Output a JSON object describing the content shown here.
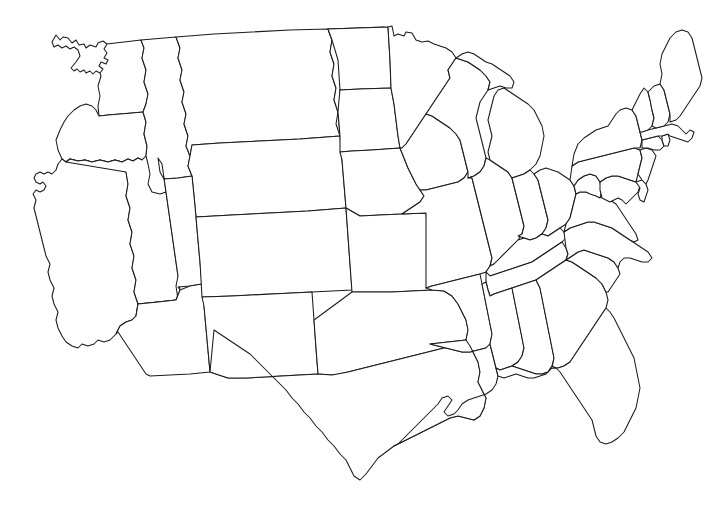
{
  "document": {
    "kind": "map",
    "title": "",
    "subtitle": "",
    "caption": "",
    "legend": "",
    "attribution": ""
  },
  "map": {
    "name": "contiguous-united-states-outline",
    "region": "United States (contiguous 48 states)",
    "projection_hint": "albers-like",
    "width": 723,
    "height": 505,
    "background_color": "#ffffff",
    "border_color": "#1a1a1a",
    "fill_color": "#ffffff",
    "border_width_px": 1,
    "labels_shown": false,
    "state_count": 48,
    "states": [
      {
        "code": "WA",
        "name": "Washington",
        "label": ""
      },
      {
        "code": "OR",
        "name": "Oregon",
        "label": ""
      },
      {
        "code": "CA",
        "name": "California",
        "label": ""
      },
      {
        "code": "NV",
        "name": "Nevada",
        "label": ""
      },
      {
        "code": "ID",
        "name": "Idaho",
        "label": ""
      },
      {
        "code": "MT",
        "name": "Montana",
        "label": ""
      },
      {
        "code": "WY",
        "name": "Wyoming",
        "label": ""
      },
      {
        "code": "UT",
        "name": "Utah",
        "label": ""
      },
      {
        "code": "AZ",
        "name": "Arizona",
        "label": ""
      },
      {
        "code": "CO",
        "name": "Colorado",
        "label": ""
      },
      {
        "code": "NM",
        "name": "New Mexico",
        "label": ""
      },
      {
        "code": "ND",
        "name": "North Dakota",
        "label": ""
      },
      {
        "code": "SD",
        "name": "South Dakota",
        "label": ""
      },
      {
        "code": "NE",
        "name": "Nebraska",
        "label": ""
      },
      {
        "code": "KS",
        "name": "Kansas",
        "label": ""
      },
      {
        "code": "OK",
        "name": "Oklahoma",
        "label": ""
      },
      {
        "code": "TX",
        "name": "Texas",
        "label": ""
      },
      {
        "code": "MN",
        "name": "Minnesota",
        "label": ""
      },
      {
        "code": "IA",
        "name": "Iowa",
        "label": ""
      },
      {
        "code": "MO",
        "name": "Missouri",
        "label": ""
      },
      {
        "code": "AR",
        "name": "Arkansas",
        "label": ""
      },
      {
        "code": "LA",
        "name": "Louisiana",
        "label": ""
      },
      {
        "code": "WI",
        "name": "Wisconsin",
        "label": ""
      },
      {
        "code": "IL",
        "name": "Illinois",
        "label": ""
      },
      {
        "code": "MI",
        "name": "Michigan",
        "label": ""
      },
      {
        "code": "IN",
        "name": "Indiana",
        "label": ""
      },
      {
        "code": "OH",
        "name": "Ohio",
        "label": ""
      },
      {
        "code": "KY",
        "name": "Kentucky",
        "label": ""
      },
      {
        "code": "TN",
        "name": "Tennessee",
        "label": ""
      },
      {
        "code": "MS",
        "name": "Mississippi",
        "label": ""
      },
      {
        "code": "AL",
        "name": "Alabama",
        "label": ""
      },
      {
        "code": "GA",
        "name": "Georgia",
        "label": ""
      },
      {
        "code": "FL",
        "name": "Florida",
        "label": ""
      },
      {
        "code": "SC",
        "name": "South Carolina",
        "label": ""
      },
      {
        "code": "NC",
        "name": "North Carolina",
        "label": ""
      },
      {
        "code": "VA",
        "name": "Virginia",
        "label": ""
      },
      {
        "code": "WV",
        "name": "West Virginia",
        "label": ""
      },
      {
        "code": "MD",
        "name": "Maryland",
        "label": ""
      },
      {
        "code": "DE",
        "name": "Delaware",
        "label": ""
      },
      {
        "code": "PA",
        "name": "Pennsylvania",
        "label": ""
      },
      {
        "code": "NJ",
        "name": "New Jersey",
        "label": ""
      },
      {
        "code": "NY",
        "name": "New York",
        "label": ""
      },
      {
        "code": "CT",
        "name": "Connecticut",
        "label": ""
      },
      {
        "code": "RI",
        "name": "Rhode Island",
        "label": ""
      },
      {
        "code": "MA",
        "name": "Massachusetts",
        "label": ""
      },
      {
        "code": "VT",
        "name": "Vermont",
        "label": ""
      },
      {
        "code": "NH",
        "name": "New Hampshire",
        "label": ""
      },
      {
        "code": "ME",
        "name": "Maine",
        "label": ""
      }
    ]
  }
}
